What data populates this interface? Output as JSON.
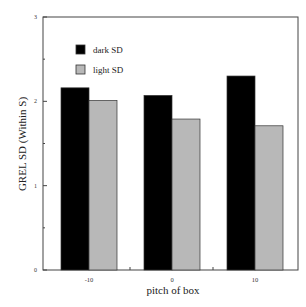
{
  "chart_data": {
    "type": "bar",
    "title": "",
    "xlabel": "pitch of box",
    "ylabel": "GREL SD (Within S)",
    "categories": [
      "-10",
      "0",
      "10"
    ],
    "series": [
      {
        "name": "dark SD",
        "color": "#000000",
        "values": [
          2.16,
          2.07,
          2.3
        ]
      },
      {
        "name": "light SD",
        "color": "#b8b8b8",
        "values": [
          2.01,
          1.79,
          1.71
        ]
      }
    ],
    "ylim": [
      0,
      3
    ],
    "yticks": [
      "0",
      "1",
      "2",
      "3"
    ],
    "grid": false,
    "legend_position": "upper-left-inside"
  },
  "legend": {
    "dark": "dark SD",
    "light": "light SD"
  },
  "axis": {
    "x": "pitch of box",
    "y": "GREL SD (Within S)"
  }
}
